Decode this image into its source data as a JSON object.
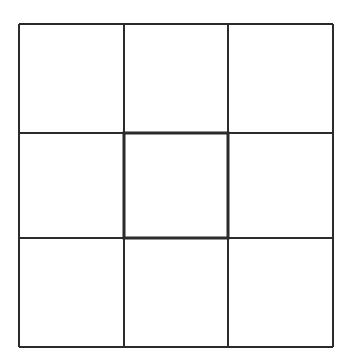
{
  "diagram": {
    "type": "grid",
    "rows": 3,
    "columns": 3,
    "line_color": "#2b2b2b",
    "background": "#ffffff",
    "outer": {
      "x": 19,
      "y": 24,
      "width": 314,
      "height": 323
    },
    "column_lines_x": [
      19,
      124,
      228,
      333
    ],
    "row_lines_y": [
      24,
      133,
      238,
      347
    ],
    "highlighted_cell": {
      "row": 1,
      "col": 1,
      "border": "thick"
    },
    "cells": [
      {
        "row": 0,
        "col": 0,
        "label": ""
      },
      {
        "row": 0,
        "col": 1,
        "label": ""
      },
      {
        "row": 0,
        "col": 2,
        "label": ""
      },
      {
        "row": 1,
        "col": 0,
        "label": ""
      },
      {
        "row": 1,
        "col": 1,
        "label": ""
      },
      {
        "row": 1,
        "col": 2,
        "label": ""
      },
      {
        "row": 2,
        "col": 0,
        "label": ""
      },
      {
        "row": 2,
        "col": 1,
        "label": ""
      },
      {
        "row": 2,
        "col": 2,
        "label": ""
      }
    ]
  }
}
